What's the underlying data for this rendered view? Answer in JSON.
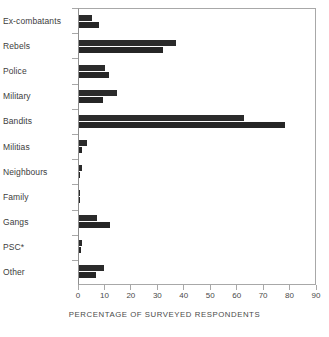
{
  "chart_data": {
    "type": "bar",
    "orientation": "horizontal",
    "title": "",
    "xlabel": "PERCENTAGE OF SURVEYED RESPONDENTS",
    "ylabel": "",
    "xlim": [
      0,
      90
    ],
    "xticks": [
      0,
      10,
      20,
      30,
      40,
      50,
      60,
      70,
      80,
      90
    ],
    "grid": false,
    "legend": "none",
    "bar_color": "#2b2b2b",
    "categories": [
      "Ex-combatants",
      "Rebels",
      "Police",
      "Military",
      "Bandits",
      "Militias",
      "Neighbours",
      "Family",
      "Gangs",
      "PSC*",
      "Other"
    ],
    "series": [
      {
        "name": "series-1",
        "values": [
          5.0,
          37.0,
          10.0,
          14.5,
          63.0,
          3.0,
          1.0,
          0.5,
          7.0,
          1.0,
          9.5
        ]
      },
      {
        "name": "series-2",
        "values": [
          7.5,
          32.0,
          11.5,
          9.0,
          78.5,
          1.0,
          0.5,
          0.4,
          12.0,
          0.8,
          6.5
        ]
      }
    ]
  }
}
